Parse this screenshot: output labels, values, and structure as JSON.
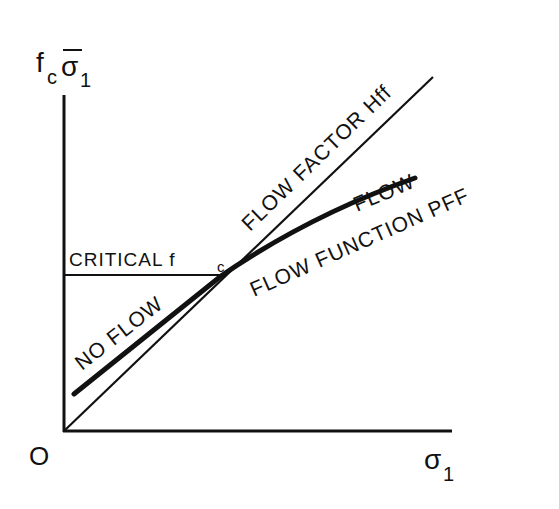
{
  "diagram": {
    "colors": {
      "ink": "#111111",
      "background": "#ffffff"
    },
    "axes": {
      "y_label_main": "f",
      "y_label_sub": "c",
      "y_label_sigma": "σ",
      "y_label_sigma_sub": "1",
      "x_label_sigma": "σ",
      "x_label_sub": "1",
      "origin_label": "O"
    },
    "lines": {
      "flow_factor_label": "FLOW FACTOR Hff",
      "flow_function_label": "FLOW FUNCTION PFF",
      "critical_label": "CRITICAL f",
      "critical_sub": "c"
    },
    "regions": {
      "flow": "FLOW",
      "no_flow": "NO FLOW"
    }
  }
}
